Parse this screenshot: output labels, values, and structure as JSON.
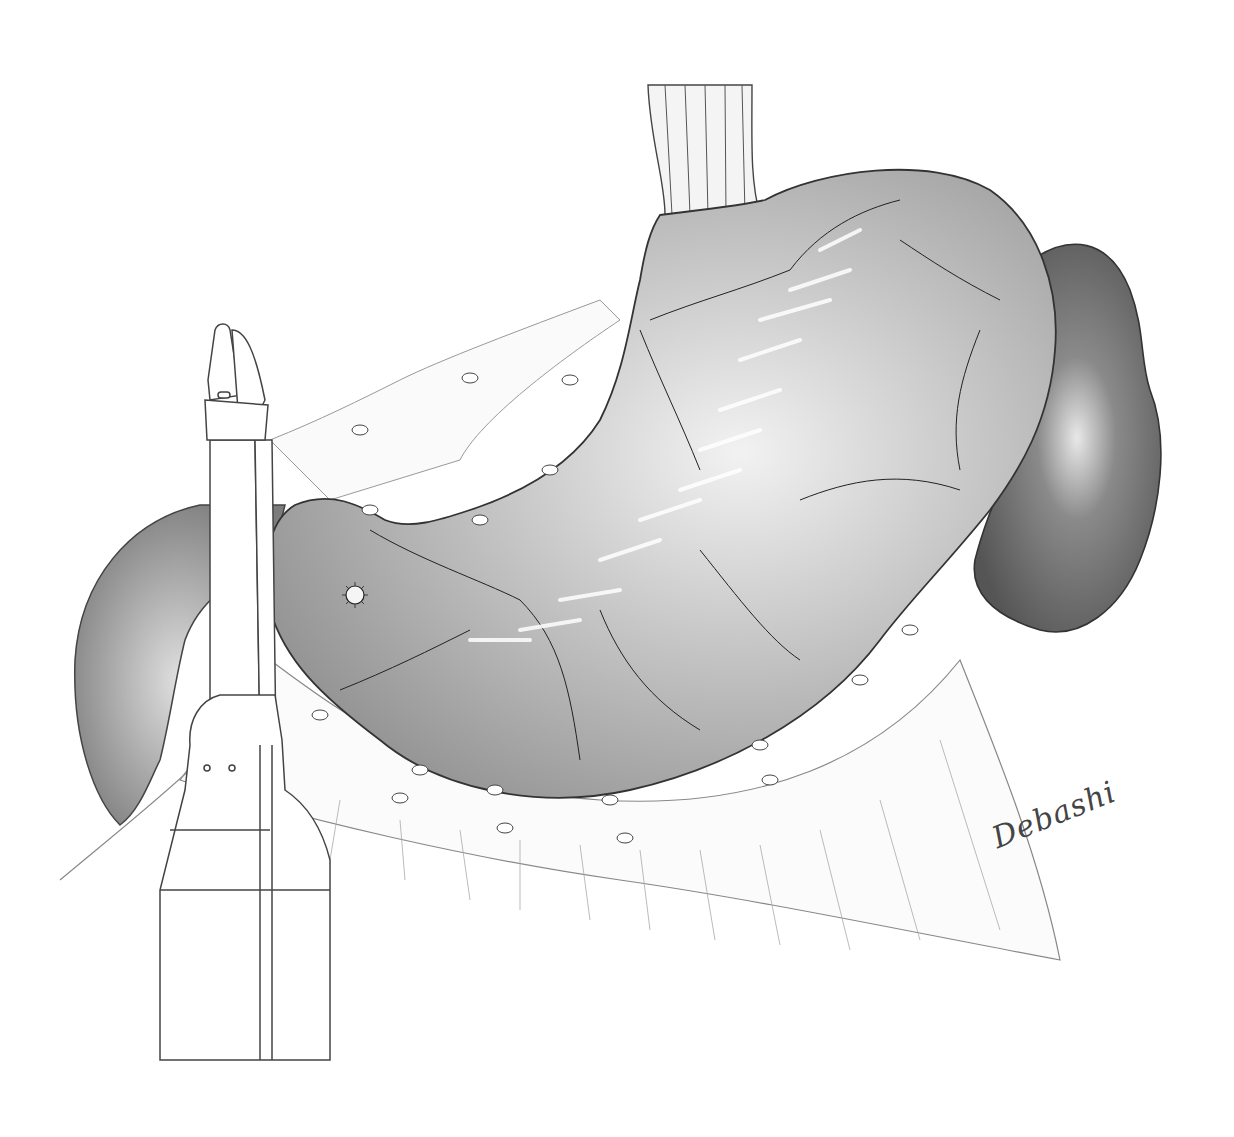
{
  "figure": {
    "type": "medical-illustration",
    "style": "grayscale pencil drawing",
    "colors": {
      "background": "#ffffff",
      "stomach_fill": "#b8b8b8",
      "stomach_highlight": "#f2f2f2",
      "spleen_fill": "#7a7a7a",
      "duodenum_fill": "#9a9a9a",
      "outline": "#333333",
      "vessel": "#222222",
      "instrument_stroke": "#444444"
    },
    "elements": [
      {
        "name": "esophagus"
      },
      {
        "name": "stomach"
      },
      {
        "name": "spleen"
      },
      {
        "name": "duodenum"
      },
      {
        "name": "omentum"
      },
      {
        "name": "ulcer-lesion"
      },
      {
        "name": "linear-stapler"
      }
    ],
    "signature": "Debashi"
  }
}
